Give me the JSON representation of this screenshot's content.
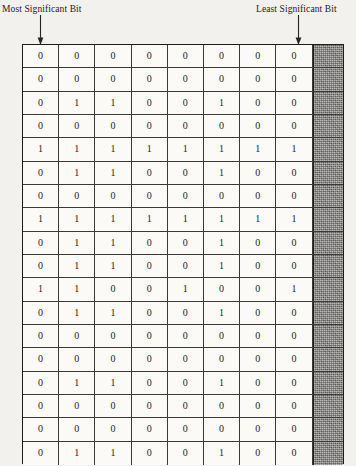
{
  "annotations": {
    "msb": {
      "label": "Most Significant Bit",
      "icon": "down-arrow-icon"
    },
    "lsb": {
      "label": "Least Significant Bit",
      "icon": "down-arrow-icon"
    }
  },
  "bit_table": {
    "columns": 8,
    "rows": 18,
    "has_shaded_trailing_column": true,
    "shaded_column_color": "#8d8b88",
    "border_color": "#1c1c1c",
    "cell_background": "#fbfaf7",
    "data": [
      [
        "0",
        "0",
        "0",
        "0",
        "0",
        "0",
        "0",
        "0"
      ],
      [
        "0",
        "0",
        "0",
        "0",
        "0",
        "0",
        "0",
        "0"
      ],
      [
        "0",
        "1",
        "1",
        "0",
        "0",
        "1",
        "0",
        "0"
      ],
      [
        "0",
        "0",
        "0",
        "0",
        "0",
        "0",
        "0",
        "0"
      ],
      [
        "1",
        "1",
        "1",
        "1",
        "1",
        "1",
        "1",
        "1"
      ],
      [
        "0",
        "1",
        "1",
        "0",
        "0",
        "1",
        "0",
        "0"
      ],
      [
        "0",
        "0",
        "0",
        "0",
        "0",
        "0",
        "0",
        "0"
      ],
      [
        "1",
        "1",
        "1",
        "1",
        "1",
        "1",
        "1",
        "1"
      ],
      [
        "0",
        "1",
        "1",
        "0",
        "0",
        "1",
        "0",
        "0"
      ],
      [
        "0",
        "1",
        "1",
        "0",
        "0",
        "1",
        "0",
        "0"
      ],
      [
        "1",
        "1",
        "0",
        "0",
        "1",
        "0",
        "0",
        "1"
      ],
      [
        "0",
        "1",
        "1",
        "0",
        "0",
        "1",
        "0",
        "0"
      ],
      [
        "0",
        "0",
        "0",
        "0",
        "0",
        "0",
        "0",
        "0"
      ],
      [
        "0",
        "0",
        "0",
        "0",
        "0",
        "0",
        "0",
        "0"
      ],
      [
        "0",
        "1",
        "1",
        "0",
        "0",
        "1",
        "0",
        "0"
      ],
      [
        "0",
        "0",
        "0",
        "0",
        "0",
        "0",
        "0",
        "0"
      ],
      [
        "0",
        "0",
        "0",
        "0",
        "0",
        "0",
        "0",
        "0"
      ],
      [
        "0",
        "1",
        "1",
        "0",
        "0",
        "1",
        "0",
        "0"
      ]
    ]
  }
}
